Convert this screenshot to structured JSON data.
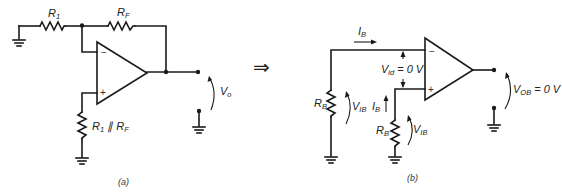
{
  "figure": {
    "panel_a": {
      "caption": "(a)",
      "labels": {
        "r1": {
          "main": "R",
          "sub": "1"
        },
        "rf": {
          "main": "R",
          "sub": "F"
        },
        "rcomp": {
          "main1": "R",
          "sub1": "1",
          "sep": " ∥ ",
          "main2": "R",
          "sub2": "F"
        },
        "vo": {
          "main": "V",
          "sub": "o"
        }
      },
      "opamp": {
        "inverting": "−",
        "noninverting": "+"
      }
    },
    "transform_arrow": "⇒",
    "panel_b": {
      "caption": "(b)",
      "labels": {
        "ib_top": {
          "main": "I",
          "sub": "B"
        },
        "rb_left": {
          "main": "R",
          "sub": "B"
        },
        "vib_left": {
          "main": "V",
          "sub": "IB"
        },
        "vid": {
          "main": "V",
          "sub": "id",
          "value": "= 0 V"
        },
        "ib_right": {
          "main": "I",
          "sub": "B"
        },
        "rb_right": {
          "main": "R",
          "sub": "B"
        },
        "vib_right": {
          "main": "V",
          "sub": "IB"
        },
        "vob": {
          "main": "V",
          "sub": "OB",
          "value": "= 0 V"
        }
      },
      "opamp": {
        "inverting": "−",
        "noninverting": "+"
      }
    }
  }
}
